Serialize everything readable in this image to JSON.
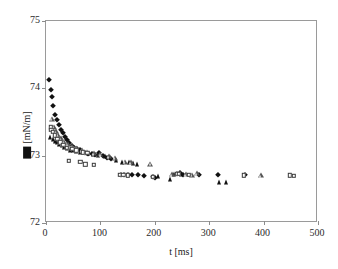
{
  "chart_data": {
    "type": "scatter",
    "title": "",
    "xlabel": "t [ms]",
    "ylabel": "■ [mN/m]",
    "ylabel_symbol": "filled-square-glyph",
    "ylabel_units": "[mN/m]",
    "xlim": [
      0,
      500
    ],
    "ylim": [
      72,
      75
    ],
    "xticks": [
      0,
      100,
      200,
      300,
      400,
      500
    ],
    "yticks": [
      72,
      73,
      74,
      75
    ],
    "xtick_labels": [
      "0",
      "100",
      "200",
      "300",
      "400",
      "500"
    ],
    "ytick_labels": [
      "72",
      "73",
      "74",
      "75"
    ],
    "grid": false,
    "legend": "none",
    "series": [
      {
        "name": "series-filled-diamond",
        "marker": "filled-diamond",
        "color": "#111111",
        "points": [
          [
            6,
            74.13
          ],
          [
            9,
            73.98
          ],
          [
            11,
            73.87
          ],
          [
            13,
            73.74
          ],
          [
            17,
            73.6
          ],
          [
            20,
            73.53
          ],
          [
            23,
            73.45
          ],
          [
            27,
            73.38
          ],
          [
            31,
            73.33
          ],
          [
            35,
            73.28
          ],
          [
            39,
            73.23
          ],
          [
            43,
            73.19
          ],
          [
            47,
            73.15
          ],
          [
            52,
            73.12
          ],
          [
            57,
            73.1
          ],
          [
            62,
            73.08
          ],
          [
            67,
            73.06
          ],
          [
            72,
            73.04
          ],
          [
            78,
            73.03
          ],
          [
            84,
            73.02
          ],
          [
            90,
            73.01
          ],
          [
            97,
            73.04
          ],
          [
            104,
            72.99
          ],
          [
            112,
            72.97
          ],
          [
            120,
            72.95
          ],
          [
            137,
            72.72
          ],
          [
            143,
            72.71
          ],
          [
            150,
            72.71
          ],
          [
            158,
            72.72
          ],
          [
            170,
            72.71
          ],
          [
            180,
            72.7
          ],
          [
            196,
            72.68
          ],
          [
            200,
            72.67
          ],
          [
            240,
            72.73
          ],
          [
            246,
            72.74
          ],
          [
            252,
            72.72
          ],
          [
            282,
            72.71
          ],
          [
            316,
            72.72
          ],
          [
            365,
            72.71
          ]
        ]
      },
      {
        "name": "series-filled-triangle",
        "marker": "filled-triangle",
        "color": "#111111",
        "points": [
          [
            8,
            73.28
          ],
          [
            12,
            73.25
          ],
          [
            16,
            73.22
          ],
          [
            20,
            73.2
          ],
          [
            24,
            73.18
          ],
          [
            29,
            73.16
          ],
          [
            34,
            73.13
          ],
          [
            39,
            73.11
          ],
          [
            44,
            73.09
          ],
          [
            50,
            73.08
          ],
          [
            56,
            73.07
          ],
          [
            63,
            73.06
          ],
          [
            70,
            73.05
          ],
          [
            78,
            73.04
          ],
          [
            86,
            73.02
          ],
          [
            95,
            73.01
          ],
          [
            108,
            73.0
          ],
          [
            118,
            72.98
          ],
          [
            128,
            72.94
          ],
          [
            140,
            72.91
          ],
          [
            152,
            72.9
          ],
          [
            160,
            72.89
          ],
          [
            168,
            72.88
          ],
          [
            205,
            72.7
          ],
          [
            228,
            72.66
          ],
          [
            236,
            72.73
          ],
          [
            248,
            72.73
          ],
          [
            318,
            72.61
          ],
          [
            330,
            72.61
          ]
        ]
      },
      {
        "name": "series-open-triangle",
        "marker": "open-triangle",
        "color": "#555555",
        "points": [
          [
            11,
            73.55
          ],
          [
            14,
            73.43
          ],
          [
            18,
            73.36
          ],
          [
            22,
            73.31
          ],
          [
            27,
            73.26
          ],
          [
            33,
            73.21
          ],
          [
            40,
            73.17
          ],
          [
            48,
            73.14
          ],
          [
            56,
            73.11
          ],
          [
            66,
            73.08
          ],
          [
            76,
            73.06
          ],
          [
            88,
            73.04
          ],
          [
            100,
            73.02
          ],
          [
            115,
            72.99
          ],
          [
            126,
            72.97
          ],
          [
            145,
            72.91
          ],
          [
            156,
            72.9
          ],
          [
            192,
            72.88
          ],
          [
            232,
            72.73
          ],
          [
            258,
            72.73
          ],
          [
            268,
            72.72
          ],
          [
            278,
            72.74
          ],
          [
            395,
            72.71
          ]
        ]
      },
      {
        "name": "series-open-square",
        "marker": "open-square",
        "color": "#3a3a3a",
        "points": [
          [
            9,
            73.42
          ],
          [
            10,
            73.38
          ],
          [
            12,
            73.35
          ],
          [
            16,
            73.3
          ],
          [
            21,
            73.25
          ],
          [
            26,
            73.2
          ],
          [
            32,
            73.16
          ],
          [
            38,
            73.12
          ],
          [
            42,
            72.92
          ],
          [
            48,
            73.1
          ],
          [
            56,
            73.08
          ],
          [
            63,
            72.91
          ],
          [
            68,
            73.05
          ],
          [
            72,
            72.87
          ],
          [
            76,
            73.04
          ],
          [
            88,
            72.86
          ],
          [
            136,
            72.72
          ],
          [
            142,
            72.72
          ],
          [
            150,
            72.71
          ],
          [
            196,
            72.69
          ],
          [
            240,
            72.73
          ],
          [
            244,
            72.73
          ],
          [
            262,
            72.72
          ],
          [
            364,
            72.71
          ],
          [
            448,
            72.71
          ],
          [
            455,
            72.7
          ]
        ]
      }
    ]
  }
}
